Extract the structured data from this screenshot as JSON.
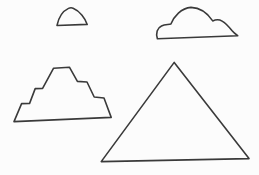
{
  "figure": {
    "width": 259,
    "height": 175,
    "background": "#fcfcfc",
    "stroke_color": "#3a3a3a",
    "stroke_width": 1.6,
    "fill": "none"
  },
  "shapes": [
    {
      "name": "dome-shape",
      "kind": "smooth-dome",
      "path": "M 57 25.5 C 58.3 19 62 11.5 68.5 8.4 C 70 7.7 71.6 7.6 73.1 8.2 C 79.6 10.9 85.1 18 87.2 24.4 Z"
    },
    {
      "name": "cloud-shape",
      "kind": "smooth-cloud",
      "path": "M 157.4 38.8 C 155.6 33 157.2 27.8 161.5 25.9 C 165 24.4 168.6 24.7 170.9 24 C 174.1 16.2 181 8.2 191 7.4 C 201 7.7 208.1 14 212.7 20.9 C 215.4 19.7 219.6 19.6 222.1 21.1 C 226.1 23.4 229.6 27.6 231.9 30.6 C 233.6 32.7 236.1 34.6 237.7 35.7 Z"
    },
    {
      "name": "stepped-pyramid-shape",
      "kind": "ziggurat",
      "path": "M 14 121.6 L 21.6 103.6 L 29.6 103.4 L 35.2 88.6 L 42.6 88.4 L 53.6 68.2 L 69.4 67.2 L 77.4 81.4 L 87 82 L 94.2 97 L 104 98 L 111.2 117.4 Z"
    },
    {
      "name": "triangle-shape",
      "kind": "smooth-triangle",
      "path": "M 174.2 62.4 L 249 158.6 L 101.2 161.6 Z"
    }
  ]
}
